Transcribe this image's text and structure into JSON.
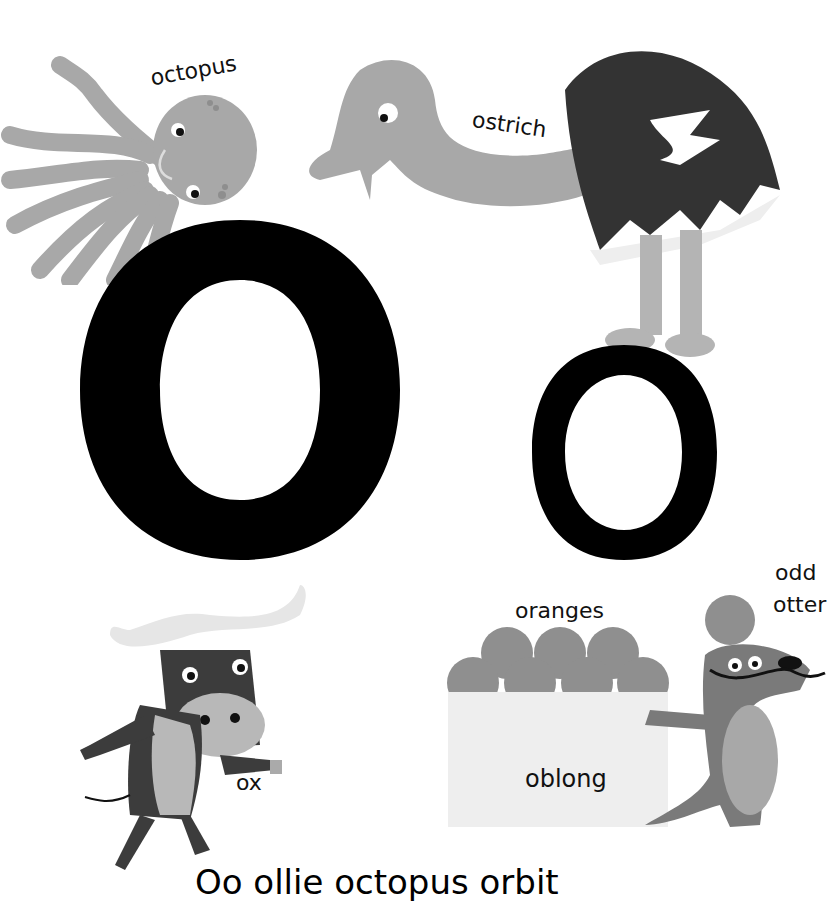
{
  "page": {
    "letter_upper": "O",
    "letter_lower": "o",
    "caption": "Oo  ollie  octopus  orbit"
  },
  "labels": {
    "octopus": "octopus",
    "ostrich": "ostrich",
    "oranges": "oranges",
    "odd": "odd",
    "otter": "otter",
    "oblong": "oblong",
    "ox": "ox"
  },
  "colors": {
    "background": "#ffffff",
    "letter": "#000000",
    "light_gray": "#a9a9a9",
    "mid_gray": "#8c8c8c",
    "dark_gray": "#3a3a3a",
    "orange_gray": "#8f8f8f",
    "box": "#eeeeee"
  }
}
